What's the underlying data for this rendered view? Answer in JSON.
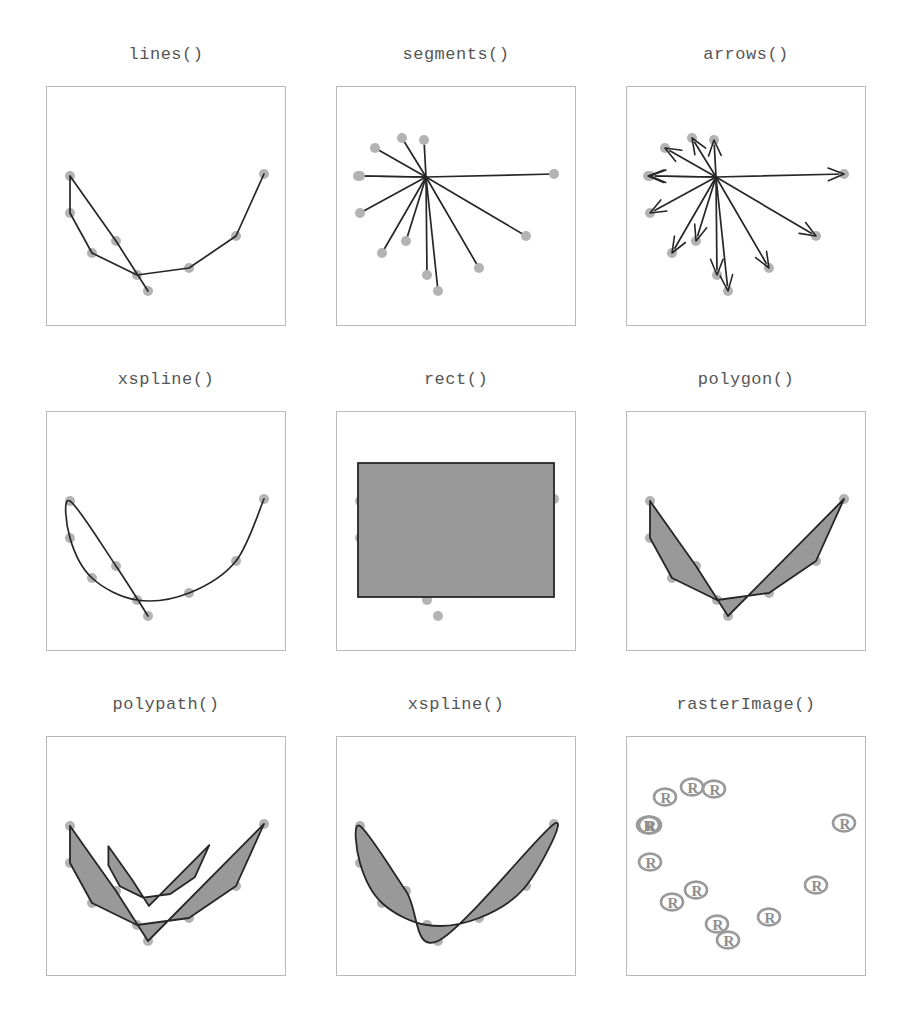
{
  "figure": {
    "width": 908,
    "height": 1020,
    "background": "#ffffff",
    "title_color": "#565656",
    "panel_border_color": "#b9b9b9",
    "point_color": "#b3b3b3",
    "line_color": "#262626",
    "fill_color": "#999999"
  },
  "panels": [
    {
      "id": "lines",
      "title": "lines()",
      "row": 0,
      "col": 0,
      "type": "polyline"
    },
    {
      "id": "segments",
      "title": "segments()",
      "row": 0,
      "col": 1,
      "type": "segments"
    },
    {
      "id": "arrows",
      "title": "arrows()",
      "row": 0,
      "col": 2,
      "type": "arrows"
    },
    {
      "id": "xspline-open",
      "title": "xspline()",
      "row": 1,
      "col": 0,
      "type": "spline-open"
    },
    {
      "id": "rect",
      "title": "rect()",
      "row": 1,
      "col": 1,
      "type": "rect"
    },
    {
      "id": "polygon",
      "title": "polygon()",
      "row": 1,
      "col": 2,
      "type": "polygon"
    },
    {
      "id": "polypath",
      "title": "polypath()",
      "row": 2,
      "col": 0,
      "type": "polypath"
    },
    {
      "id": "xspline-fill",
      "title": "xspline()",
      "row": 2,
      "col": 1,
      "type": "spline-closed"
    },
    {
      "id": "rasterimage",
      "title": "rasterImage()",
      "row": 2,
      "col": 2,
      "type": "raster"
    }
  ],
  "chart_data": {
    "type": "scatter",
    "xlabel": "",
    "ylabel": "",
    "xlim": [
      0,
      240
    ],
    "ylim": [
      0,
      240
    ],
    "grid": false,
    "legend": null,
    "point_radius": 5,
    "points": [
      {
        "x": 102,
        "y": 205
      },
      {
        "x": 70,
        "y": 155
      },
      {
        "x": 24,
        "y": 90
      },
      {
        "x": 24,
        "y": 127
      },
      {
        "x": 46,
        "y": 167
      },
      {
        "x": 91,
        "y": 189
      },
      {
        "x": 143,
        "y": 182
      },
      {
        "x": 190,
        "y": 150
      },
      {
        "x": 218,
        "y": 88
      }
    ],
    "segments_center": {
      "x": 90,
      "y": 91
    },
    "segment_endpoints": [
      {
        "x": 102,
        "y": 205
      },
      {
        "x": 70,
        "y": 155
      },
      {
        "x": 24,
        "y": 90
      },
      {
        "x": 24,
        "y": 127
      },
      {
        "x": 46,
        "y": 167
      },
      {
        "x": 91,
        "y": 189
      },
      {
        "x": 143,
        "y": 182
      },
      {
        "x": 190,
        "y": 150
      },
      {
        "x": 218,
        "y": 88
      },
      {
        "x": 66,
        "y": 52
      },
      {
        "x": 39,
        "y": 62
      },
      {
        "x": 22,
        "y": 90
      },
      {
        "x": 88,
        "y": 54
      }
    ],
    "rect_bounds": {
      "x": 22,
      "y": 52,
      "width": 196,
      "height": 134
    },
    "raster_logo_label": "R",
    "raster_logo_count": 13
  }
}
